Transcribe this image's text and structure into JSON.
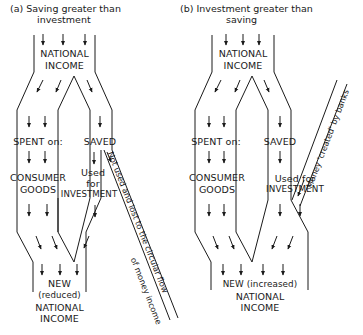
{
  "panel_a": {
    "title_line1": "(a) Saving greater than",
    "title_line2": "investment",
    "top_label_1": "NATIONAL",
    "top_label_2": "INCOME",
    "spent_label": "SPENT on:",
    "saved_label": "SAVED",
    "consumer_1": "CONSUMER",
    "consumer_2": "GOODS",
    "used_1": "Used",
    "used_2": "for",
    "used_3": "INVESTMENT",
    "leak_line1": "Not used and lost to the circular flow",
    "leak_line2": "of money income",
    "new_1": "NEW",
    "new_2": "(reduced)",
    "new_3": "NATIONAL",
    "new_4": "INCOME"
  },
  "panel_b": {
    "title_line1": "(b) Investment greater than",
    "title_line2": "saving",
    "top_label_1": "NATIONAL",
    "top_label_2": "INCOME",
    "spent_label": "SPENT on:",
    "saved_label": "SAVED",
    "consumer_1": "CONSUMER",
    "consumer_2": "GOODS",
    "used_1": "Used for",
    "used_2": "INVESTMENT",
    "injection_label": "Money 'created' by banks",
    "new_1": "NEW (increased)",
    "new_2": "NATIONAL",
    "new_3": "INCOME"
  }
}
